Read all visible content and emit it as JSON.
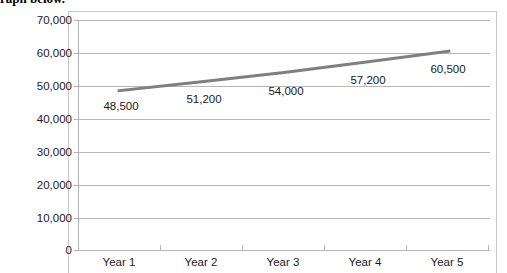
{
  "document": {
    "heading_partial": "raph below."
  },
  "chart_data": {
    "type": "line",
    "title": "",
    "subtitle": "",
    "xlabel": "",
    "ylabel": "",
    "categories": [
      "Year 1",
      "Year 2",
      "Year 3",
      "Year 4",
      "Year 5"
    ],
    "values": [
      48500,
      51200,
      54000,
      57200,
      60500
    ],
    "data_labels": [
      "48,500",
      "51,200",
      "54,000",
      "57,200",
      "60,500"
    ],
    "ylim": [
      0,
      70000
    ],
    "ytick_step": 10000,
    "ytick_labels": [
      "70,000",
      "60,000",
      "50,000",
      "40,000",
      "30,000",
      "20,000",
      "10,000",
      "0"
    ],
    "ytick_values": [
      70000,
      60000,
      50000,
      40000,
      30000,
      20000,
      10000,
      0
    ],
    "grid": "horizontal",
    "legend": "none",
    "series": [
      {
        "name": "Series 1",
        "values": [
          48500,
          51200,
          54000,
          57200,
          60500
        ],
        "color": "#7f7f7f",
        "line_width": 3,
        "markers": "none"
      }
    ],
    "colors": {
      "line": "#7f7f7f",
      "gridline": "#b5b5b5",
      "axis": "#b5b5b5",
      "frame_border": "#c9c9c9",
      "text": "#1a1a1a",
      "plot_background": "#ffffff"
    }
  }
}
